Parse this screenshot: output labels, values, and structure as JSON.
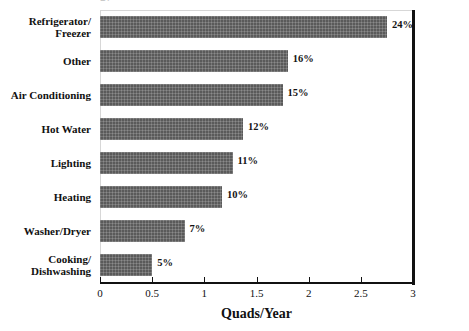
{
  "chart_data": {
    "type": "bar",
    "orientation": "horizontal",
    "title": "gy",
    "xlabel": "Quads/Year",
    "ylabel": "",
    "xlim": [
      0,
      3
    ],
    "xticks": [
      "0",
      "0.5",
      "1",
      "1.5",
      "2",
      "2.5",
      "3"
    ],
    "xtick_values": [
      0,
      0.5,
      1,
      1.5,
      2,
      2.5,
      3
    ],
    "grid": false,
    "legend": false,
    "bar_color": "#5a5a5a",
    "categories": [
      "Refrigerator/\nFreezer",
      "Other",
      "Air Conditioning",
      "Hot Water",
      "Lighting",
      "Heating",
      "Washer/Dryer",
      "Cooking/\nDishwashing"
    ],
    "values": [
      2.75,
      1.8,
      1.75,
      1.37,
      1.27,
      1.17,
      0.81,
      0.5
    ],
    "data_labels": [
      "24%",
      "16%",
      "15%",
      "12%",
      "11%",
      "10%",
      "7%",
      "5%"
    ],
    "percent_values": [
      24,
      16,
      15,
      12,
      11,
      10,
      7,
      5
    ]
  }
}
